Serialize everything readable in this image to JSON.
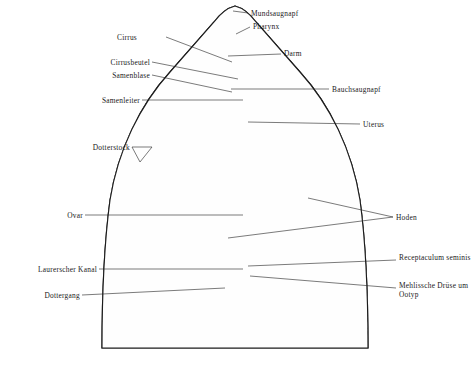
{
  "figure": {
    "organism": "Leberegel",
    "background_color": "#ffffff",
    "ink_color": "#1b1b1b",
    "view": "dorsal",
    "body_shape": "pointed anterior cone, broad dome-shaped body, flat cut bottom edge"
  },
  "labels_left": [
    {
      "id": "cirrus",
      "text": "Cirrus",
      "x": 137,
      "y": 38,
      "line_to_x": 232,
      "line_to_y": 62
    },
    {
      "id": "cirrusbeutel",
      "text": "Cirrusbeutel",
      "x": 110,
      "y": 63,
      "line_to_x": 238,
      "line_to_y": 79
    },
    {
      "id": "samenblase",
      "text": "Samenblase",
      "x": 112,
      "y": 76,
      "line_to_x": 232,
      "line_to_y": 92
    },
    {
      "id": "samenleiter",
      "text": "Samenleiter",
      "x": 88,
      "y": 101,
      "line_to_x": 243,
      "line_to_y": 101
    },
    {
      "id": "dotterstock",
      "text": "Dotterstock",
      "x": 87,
      "y": 148,
      "line_to_x": 152,
      "line_to_y": 160
    },
    {
      "id": "ovar",
      "text": "Ovar",
      "x": 63,
      "y": 216,
      "line_to_x": 243,
      "line_to_y": 216
    },
    {
      "id": "laurerscher-kanal",
      "text": "Laurerscher Kanal",
      "x": 10,
      "y": 270,
      "line_to_x": 243,
      "line_to_y": 270
    },
    {
      "id": "dottergang",
      "text": "Dottergang",
      "x": 35,
      "y": 296,
      "line_to_x": 225,
      "line_to_y": 288
    }
  ],
  "labels_right": [
    {
      "id": "mundsaugnapf",
      "text": "Mundsaugnapf",
      "x": 250,
      "y": 14,
      "line_to_x": 232,
      "line_to_y": 12
    },
    {
      "id": "pharynx",
      "text": "Pharynx",
      "x": 253,
      "y": 27,
      "line_to_x": 234,
      "line_to_y": 34
    },
    {
      "id": "darm",
      "text": "Darm",
      "x": 283,
      "y": 54,
      "line_to_x": 228,
      "line_to_y": 56
    },
    {
      "id": "bauchsaugnapf",
      "text": "Bauchsaugnapf",
      "x": 331,
      "y": 90,
      "line_to_x": 231,
      "line_to_y": 90
    },
    {
      "id": "uterus",
      "text": "Uterus",
      "x": 362,
      "y": 125,
      "line_to_x": 248,
      "line_to_y": 122
    },
    {
      "id": "hoden",
      "text": "Hoden",
      "x": 395,
      "y": 218,
      "line_to_x": 230,
      "line_to_y": 238
    },
    {
      "id": "receptaculum",
      "text": "Receptaculum seminis",
      "x": 398,
      "y": 258,
      "line_to_x": 248,
      "line_to_y": 266
    },
    {
      "id": "mehlissche",
      "text": "Mehlissche Drüse um Ootyp",
      "x": 398,
      "y": 286,
      "line_to_x": 250,
      "line_to_y": 278
    }
  ],
  "regions": [
    {
      "id": "vitellarium-left",
      "name": "Dotterstock",
      "texture": "dense-dark-branching"
    },
    {
      "id": "vitellarium-right",
      "name": "Dotterstock",
      "texture": "dense-dark-branching"
    },
    {
      "id": "testes",
      "name": "Hoden",
      "texture": "fine-dotted-branching"
    },
    {
      "id": "uterus-coils",
      "name": "Uterus",
      "texture": "thick-looping-tubes"
    },
    {
      "id": "gut-caeca",
      "name": "Darm",
      "texture": "light-dendritic"
    }
  ]
}
